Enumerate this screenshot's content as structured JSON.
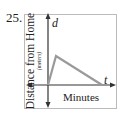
{
  "problem": {
    "number": "25."
  },
  "graph": {
    "y_axis": {
      "label": "Distance from Home",
      "unit": "(meters)",
      "variable": "d"
    },
    "x_axis": {
      "label": "Minutes",
      "variable": "t"
    },
    "line_color": "#9a9a9a",
    "axis_color": "#333333",
    "border_color": "#bbbbbb",
    "shape": "rises steeply from origin to a peak, then declines linearly back to zero"
  }
}
